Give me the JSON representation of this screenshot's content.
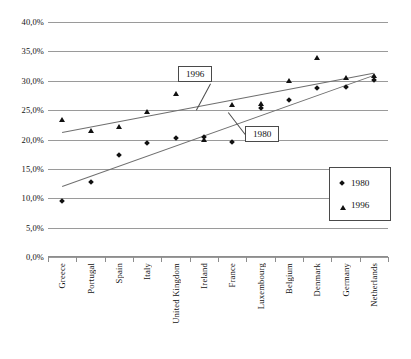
{
  "chart_data": {
    "type": "scatter",
    "title": "",
    "xlabel": "",
    "ylabel": "",
    "ylim": [
      0,
      40
    ],
    "ytick_labels": [
      "40,0%",
      "35,0%",
      "30,0%",
      "25,0%",
      "20,0%",
      "15,0%",
      "10,0%",
      "5,0%",
      "0,0%"
    ],
    "ytick_values": [
      40,
      35,
      30,
      25,
      20,
      15,
      10,
      5,
      0
    ],
    "grid": true,
    "legend_position": "bottom-right",
    "categories": [
      "Greece",
      "Portugal",
      "Spain",
      "Italy",
      "United Kingdom",
      "Ireland",
      "France",
      "Luxembourg",
      "Belgium",
      "Denmark",
      "Germany",
      "Netherlands"
    ],
    "series": [
      {
        "name": "1980",
        "marker": "diamond",
        "values": [
          9.5,
          12.8,
          17.3,
          19.4,
          20.2,
          20.4,
          19.5,
          25.4,
          26.8,
          28.8,
          29.0,
          30.2
        ]
      },
      {
        "name": "1996",
        "marker": "triangle",
        "values": [
          23.4,
          21.5,
          22.2,
          24.7,
          27.8,
          20.0,
          25.9,
          26.1,
          30.0,
          33.9,
          30.4,
          30.8
        ]
      }
    ],
    "trendlines": [
      {
        "name": "1996",
        "x_start": 0,
        "y_start": 21.3,
        "x_end": 11,
        "y_end": 31.4
      },
      {
        "name": "1980",
        "x_start": 0,
        "y_start": 12.1,
        "x_end": 11,
        "y_end": 31.0
      }
    ],
    "annotations": [
      {
        "label": "1996",
        "name": "callout-1996"
      },
      {
        "label": "1980",
        "name": "callout-1980"
      }
    ],
    "legend": [
      {
        "label": "1980",
        "marker": "diamond"
      },
      {
        "label": "1996",
        "marker": "triangle"
      }
    ]
  }
}
